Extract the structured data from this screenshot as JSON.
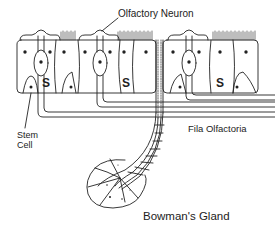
{
  "diagram": {
    "labels": {
      "olfactory_neuron": "Olfactory Neuron",
      "stem_cell_line1": "Stem",
      "stem_cell_line2": "Cell",
      "fila_olfactoria": "Fila Olfactoria",
      "bowmans_gland": "Bowman's Gland"
    },
    "cell_markers": [
      "S",
      "S",
      "S"
    ],
    "colors": {
      "stroke": "#222222",
      "background": "#ffffff"
    }
  }
}
